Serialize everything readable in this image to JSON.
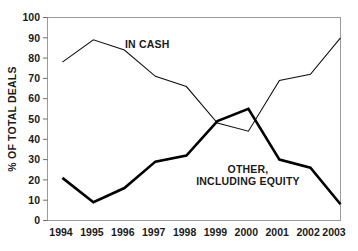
{
  "chart_data": {
    "type": "line",
    "title": "",
    "xlabel": "",
    "ylabel": "% OF TOTAL DEALS",
    "categories": [
      "1994",
      "1995",
      "1996",
      "1997",
      "1998",
      "1999",
      "2000",
      "2001",
      "2002",
      "2003"
    ],
    "x": [
      1994,
      1995,
      1996,
      1997,
      1998,
      1999,
      2000,
      2001,
      2002,
      2003
    ],
    "ylim": [
      0,
      100
    ],
    "yticks": [
      0,
      10,
      20,
      30,
      40,
      50,
      60,
      70,
      80,
      90,
      100
    ],
    "ytick_labels": [
      "0",
      "10",
      "20",
      "30",
      "40",
      "50",
      "60",
      "70",
      "80",
      "90",
      "100"
    ],
    "grid": false,
    "legend_position": "inline-annotation",
    "series": [
      {
        "name": "IN CASH",
        "style": "thin",
        "color": "#111111",
        "values": [
          78,
          89,
          84,
          71,
          66,
          48,
          44,
          69,
          72,
          90
        ]
      },
      {
        "name": "OTHER, INCLUDING EQUITY",
        "style": "bold",
        "color": "#000000",
        "values": [
          21,
          9,
          16,
          29,
          32,
          49,
          55,
          30,
          26,
          8
        ]
      }
    ],
    "annotations": [
      {
        "text": "IN CASH",
        "series": "IN CASH"
      },
      {
        "text": "OTHER,",
        "series": "OTHER, INCLUDING EQUITY"
      },
      {
        "text": "INCLUDING EQUITY",
        "series": "OTHER, INCLUDING EQUITY"
      }
    ]
  },
  "axis": {
    "y_title": "% OF TOTAL DEALS",
    "y_labels": {
      "t0": "0",
      "t10": "10",
      "t20": "20",
      "t30": "30",
      "t40": "40",
      "t50": "50",
      "t60": "60",
      "t70": "70",
      "t80": "80",
      "t90": "90",
      "t100": "100"
    },
    "x_labels": {
      "y1994": "1994",
      "y1995": "1995",
      "y1996": "1996",
      "y1997": "1997",
      "y1998": "1998",
      "y1999": "1999",
      "y2000": "2000",
      "y2001": "2001",
      "y2002": "2002",
      "y2003": "2003"
    }
  },
  "labels": {
    "in_cash": "IN CASH",
    "other_line1": "OTHER,",
    "other_line2": "INCLUDING EQUITY"
  },
  "colors": {
    "series_in_cash": "#111111",
    "series_other": "#000000",
    "frame": "#9a9a9a",
    "text": "#1a1a1a",
    "background": "#ffffff"
  }
}
